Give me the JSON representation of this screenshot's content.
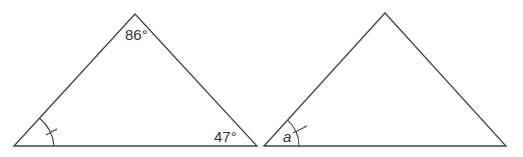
{
  "diagram": {
    "triangles": [
      {
        "id": "triangle-left",
        "vertices": [
          [
            14,
            146
          ],
          [
            135,
            14
          ],
          [
            257,
            146
          ]
        ],
        "angle_labels": {
          "top": "86°",
          "bottom_right": "47°"
        },
        "marked_angle": "bottom_left"
      },
      {
        "id": "triangle-right",
        "vertices": [
          [
            264,
            146
          ],
          [
            385,
            13
          ],
          [
            506,
            146
          ]
        ],
        "angle_labels": {
          "bottom_left": "a"
        },
        "marked_angle": "bottom_left"
      }
    ],
    "line_color": "#444444",
    "text_color": "#333333"
  }
}
